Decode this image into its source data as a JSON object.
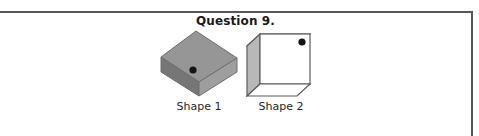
{
  "question": {
    "title": "Question 9."
  },
  "figure": {
    "shapes": [
      {
        "label": "Shape 1",
        "description": "gray-cube-corner-view",
        "dot_face": "front-left-vertical-edge",
        "colors": {
          "top_face": "#8f8f8f",
          "left_face": "#7a7a7a",
          "right_face": "#9a9a9a",
          "outline": "#6b6b6b",
          "dot": "#141414"
        }
      },
      {
        "label": "Shape 2",
        "description": "white-cube-front-view",
        "dot_face": "front-top-right",
        "colors": {
          "front_face": "#ffffff",
          "left_face": "#b5b5b5",
          "top_face": "#ffffff",
          "outline": "#5c5c5c",
          "dot": "#141414"
        }
      }
    ]
  },
  "frame": {
    "line_color": "#575757"
  }
}
